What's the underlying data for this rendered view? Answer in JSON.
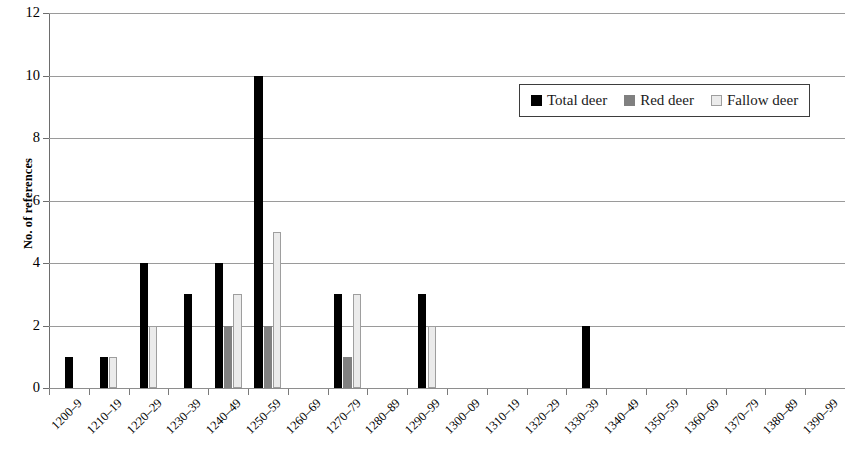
{
  "chart_data": {
    "type": "bar",
    "title": "",
    "xlabel": "",
    "ylabel": "No. of references",
    "ylim": [
      0,
      12
    ],
    "ytick_step": 2,
    "yticks": [
      0,
      2,
      4,
      6,
      8,
      10,
      12
    ],
    "grid": true,
    "legend_position": "upper right",
    "categories": [
      "1200–9",
      "1210–19",
      "1220–29",
      "1230–39",
      "1240–49",
      "1250–59",
      "1260–69",
      "1270–79",
      "1280–89",
      "1290–99",
      "1300–09",
      "1310–19",
      "1320–29",
      "1330–39",
      "1340–49",
      "1350–59",
      "1360–69",
      "1370–79",
      "1380–89",
      "1390–99"
    ],
    "series": [
      {
        "name": "Total deer",
        "color": "#000000",
        "values": [
          1,
          1,
          4,
          3,
          4,
          10,
          0,
          3,
          0,
          3,
          0,
          0,
          0,
          2,
          0,
          0,
          0,
          0,
          0,
          0
        ]
      },
      {
        "name": "Red deer",
        "color": "#808080",
        "values": [
          0,
          0,
          0,
          0,
          2,
          2,
          0,
          1,
          0,
          0,
          0,
          0,
          0,
          0,
          0,
          0,
          0,
          0,
          0,
          0
        ]
      },
      {
        "name": "Fallow deer",
        "color": "#ebebeb",
        "values": [
          0,
          1,
          2,
          0,
          3,
          5,
          0,
          3,
          0,
          2,
          0,
          0,
          0,
          0,
          0,
          0,
          0,
          0,
          0,
          0
        ]
      }
    ]
  }
}
